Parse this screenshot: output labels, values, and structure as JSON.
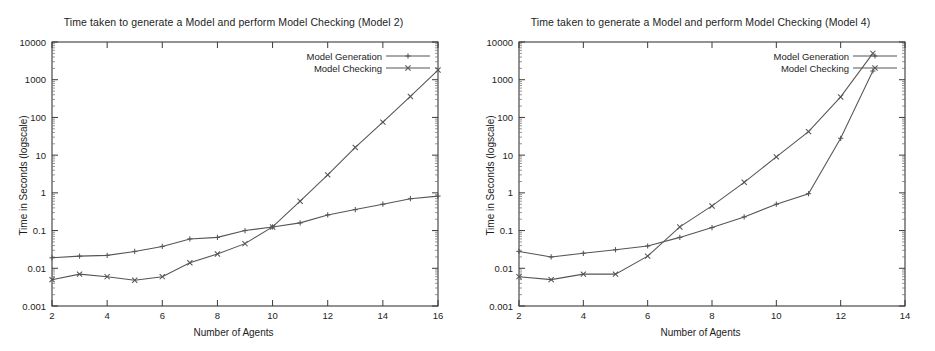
{
  "figure": {
    "panel_count": 2,
    "background_color": "#ffffff",
    "line_color": "#555555",
    "axis_color": "#3a3a3a"
  },
  "panels": [
    {
      "id": "model-2",
      "title": "Time taken to generate a Model and perform Model Checking (Model 2)",
      "xlabel": "Number of Agents",
      "ylabel": "Time in Seconds (logscale)",
      "legend": [
        {
          "label": "Model Generation",
          "marker": "plus"
        },
        {
          "label": "Model Checking",
          "marker": "cross"
        }
      ],
      "x_ticks": [
        "2",
        "4",
        "6",
        "8",
        "10",
        "12",
        "14",
        "16"
      ],
      "y_ticks": [
        "0.001",
        "0.01",
        "0.1",
        "1",
        "10",
        "100",
        "1000",
        "10000"
      ]
    },
    {
      "id": "model-4",
      "title": "Time taken to generate a Model and perform Model Checking (Model 4)",
      "xlabel": "Number of Agents",
      "ylabel": "Time in Seconds (logscale)",
      "legend": [
        {
          "label": "Model Generation",
          "marker": "plus"
        },
        {
          "label": "Model Checking",
          "marker": "cross"
        }
      ],
      "x_ticks": [
        "2",
        "4",
        "6",
        "8",
        "10",
        "12",
        "14"
      ],
      "y_ticks": [
        "0.001",
        "0.01",
        "0.1",
        "1",
        "10",
        "100",
        "1000",
        "10000"
      ]
    }
  ],
  "chart_data": [
    {
      "type": "line",
      "title": "Time taken to generate a Model and perform Model Checking (Model 2)",
      "xlabel": "Number of Agents",
      "ylabel": "Time in Seconds (logscale)",
      "yscale": "log",
      "xlim": [
        2,
        16
      ],
      "ylim": [
        0.001,
        10000
      ],
      "grid": false,
      "legend_position": "top-right",
      "x": [
        2,
        3,
        4,
        5,
        6,
        7,
        8,
        9,
        10,
        11,
        12,
        13,
        14,
        15,
        16
      ],
      "series": [
        {
          "name": "Model Generation",
          "marker": "plus",
          "values": [
            0.019,
            0.021,
            0.022,
            0.028,
            0.038,
            0.06,
            0.066,
            0.1,
            0.125,
            0.16,
            0.26,
            0.36,
            0.5,
            0.7,
            0.82
          ]
        },
        {
          "name": "Model Checking",
          "marker": "cross",
          "values": [
            0.005,
            0.007,
            0.006,
            0.0048,
            0.006,
            0.014,
            0.024,
            0.045,
            0.125,
            0.6,
            3.0,
            16.0,
            75.0,
            360.0,
            1800.0
          ]
        }
      ]
    },
    {
      "type": "line",
      "title": "Time taken to generate a Model and perform Model Checking (Model 4)",
      "xlabel": "Number of Agents",
      "ylabel": "Time in Seconds (logscale)",
      "yscale": "log",
      "xlim": [
        2,
        14
      ],
      "ylim": [
        0.001,
        10000
      ],
      "grid": false,
      "legend_position": "top-right",
      "x": [
        2,
        3,
        4,
        5,
        6,
        7,
        8,
        9,
        10,
        11,
        12,
        13
      ],
      "series": [
        {
          "name": "Model Generation",
          "marker": "plus",
          "values": [
            0.028,
            0.02,
            0.025,
            0.031,
            0.039,
            0.066,
            0.12,
            0.23,
            0.5,
            0.95,
            28.0,
            1700.0
          ]
        },
        {
          "name": "Model Checking",
          "marker": "cross",
          "values": [
            0.006,
            0.005,
            0.007,
            0.007,
            0.021,
            0.125,
            0.45,
            1.9,
            9.0,
            42.0,
            350.0,
            5000.0
          ]
        }
      ]
    }
  ]
}
